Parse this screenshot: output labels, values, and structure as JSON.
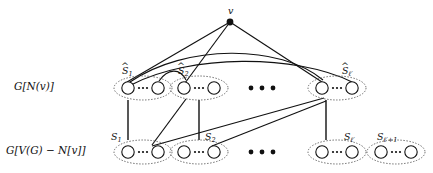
{
  "figure": {
    "type": "graph-diagram",
    "background_color": "#ffffff",
    "ink_color": "#111111",
    "width": 433,
    "height": 173,
    "apex_vertex": {
      "name": "v",
      "label": "v",
      "x": 230,
      "y": 22,
      "radius": 3.4,
      "filled": true
    },
    "rows": [
      {
        "id": "top",
        "row_label": "G[N(v)]",
        "row_label_x": 14,
        "row_label_y": 83,
        "center_y": 88,
        "group_label_prefix": "S",
        "group_label_hat": true,
        "groups": [
          {
            "id": "hat-s-1",
            "label_base": "S",
            "hat": true,
            "subscript": "1",
            "cx": 143,
            "label_x": 124,
            "label_y": 70
          },
          {
            "id": "hat-s-2",
            "label_base": "S",
            "hat": true,
            "subscript": "2",
            "cx": 199,
            "label_x": 180,
            "label_y": 70
          },
          {
            "id": "hat-s-lprime",
            "label_base": "S",
            "hat": true,
            "subscript": "ℓ′",
            "cx": 337,
            "label_x": 344,
            "label_y": 70
          }
        ],
        "ellipsis_x": 262,
        "ellipsis_y": 88
      },
      {
        "id": "bottom",
        "row_label": "G[V(G) − N[v]]",
        "row_label_x": 8,
        "row_label_y": 148,
        "center_y": 152,
        "group_label_prefix": "S",
        "group_label_hat": false,
        "groups": [
          {
            "id": "s-1",
            "label_base": "S",
            "hat": false,
            "subscript": "1",
            "cx": 143,
            "label_x": 124,
            "label_y": 136
          },
          {
            "id": "s-2",
            "label_base": "S",
            "hat": false,
            "subscript": "2",
            "cx": 199,
            "label_x": 207,
            "label_y": 136
          },
          {
            "id": "s-lprime",
            "label_base": "S",
            "hat": false,
            "subscript": "ℓ′",
            "cx": 337,
            "label_x": 345,
            "label_y": 136
          },
          {
            "id": "s-lprime-plus-1",
            "label_base": "S",
            "hat": false,
            "subscript": "ℓ′+1",
            "cx": 396,
            "label_x": 379,
            "label_y": 136
          }
        ],
        "ellipsis_x": 262,
        "ellipsis_y": 152
      }
    ],
    "group_shape": {
      "ellipse_rx": 29,
      "ellipse_ry": 12,
      "ellipse_stroke_dash": "1.4 1.6",
      "node_radius": 6.2,
      "node_offset": 15,
      "inner_dots": 3
    },
    "edges_from_apex": [
      {
        "from": "v",
        "to": "hat-s-1-left"
      },
      {
        "from": "v",
        "to": "hat-s-2-left"
      },
      {
        "from": "v",
        "to": "hat-s-lprime-left"
      }
    ],
    "arcs_top_row": [
      {
        "from": "hat-s-1-right",
        "to": "hat-s-2-left"
      },
      {
        "from": "hat-s-1-right",
        "to": "hat-s-lprime-left"
      },
      {
        "from": "hat-s-1-right",
        "to": "hat-s-lprime-right"
      }
    ],
    "vertical_links": [
      {
        "from": "hat-s-1-left",
        "to": "s-1-left"
      },
      {
        "from": "hat-s-2-right",
        "to": "s-2-left"
      },
      {
        "from": "hat-s-lprime-left",
        "to": "s-lprime-left"
      }
    ],
    "diagonal_links": [
      {
        "from": "hat-s-2-left",
        "to": "s-1-right"
      },
      {
        "from": "hat-s-lprime-left",
        "to": "s-1-right"
      },
      {
        "from": "hat-s-lprime-left",
        "to": "s-2-right"
      }
    ],
    "ellipsis_glyph": "···",
    "inner_ellipsis_glyph": "···"
  }
}
